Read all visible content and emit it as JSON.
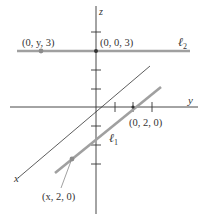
{
  "axes": {
    "x_label": "x",
    "y_label": "y",
    "z_label": "z"
  },
  "lines": {
    "l1": {
      "name": "ℓ",
      "subscript": "1",
      "color": "#a0a0a0"
    },
    "l2": {
      "name": "ℓ",
      "subscript": "2",
      "color": "#a0a0a0"
    }
  },
  "points": {
    "p_0y3": "(0, y, 3)",
    "p_003": "(0, 0, 3)",
    "p_020": "(0, 2, 0)",
    "p_x20": "(x, 2, 0)"
  },
  "colors": {
    "axis": "#333333",
    "highlight_line": "#a0a0a0",
    "point": "#8c8c8c"
  }
}
